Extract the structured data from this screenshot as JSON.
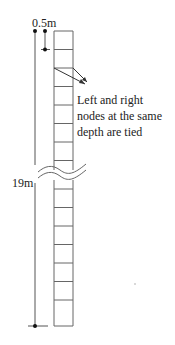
{
  "diagram": {
    "type": "soil-column-mesh",
    "labels": {
      "top_width": "0.5m",
      "depth": "19m",
      "note_line1": "Left and right",
      "note_line2": "nodes at the same",
      "note_line3": "depth are tied"
    },
    "column": {
      "x_left": 54,
      "x_right": 73,
      "y_top": 31,
      "y_bottom": 326,
      "upper_rows_y": [
        31,
        49.5,
        68,
        86.5,
        105,
        123.5,
        142,
        160.5
      ],
      "lower_rows_y": [
        189,
        207.5,
        226,
        244.5,
        263,
        281.5,
        300,
        318.5,
        326
      ]
    },
    "colors": {
      "line": "#555555",
      "dim": "#333333",
      "dot": "#111111"
    }
  }
}
